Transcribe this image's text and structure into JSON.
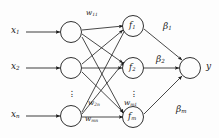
{
  "figure": {
    "type": "neural-network-diagram",
    "title": "",
    "background_color": "#fdfdfd",
    "stroke_color": "#1a1a1a"
  },
  "input_layer": {
    "labels": [
      {
        "base": "x",
        "sub": "1"
      },
      {
        "base": "x",
        "sub": "2"
      },
      {
        "base": "x",
        "sub": "n"
      }
    ],
    "ellipsis": "vertical-dots",
    "node_count_shown": 3
  },
  "hidden_layer": {
    "labels": [
      {
        "base": "f",
        "sub": "1"
      },
      {
        "base": "f",
        "sub": "2"
      },
      {
        "base": "f",
        "sub": "m"
      }
    ],
    "ellipsis": "vertical-dots",
    "node_count_shown": 3
  },
  "output_layer": {
    "label": {
      "base": "y",
      "sub": ""
    },
    "node_count_shown": 1
  },
  "input_weights": [
    {
      "base": "w",
      "sub": "11"
    },
    {
      "base": "w",
      "sub": "2n"
    },
    {
      "base": "w",
      "sub": "mn"
    },
    {
      "base": "w",
      "sub": "m1"
    }
  ],
  "output_weights": [
    {
      "base": "β",
      "sub": "1"
    },
    {
      "base": "β",
      "sub": "2"
    },
    {
      "base": "β",
      "sub": "m"
    }
  ]
}
